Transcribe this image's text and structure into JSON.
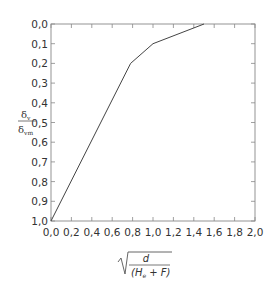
{
  "chart_data": {
    "type": "line",
    "title": "",
    "xlabel": {
      "numerator": "d",
      "denominator_open": "(H",
      "denominator_sub": "e",
      "denominator_rest": " + F)",
      "radical": "√"
    },
    "ylabel": {
      "numerator": "δ",
      "numerator_sub": "v",
      "denominator": "δ",
      "denominator_sub": "vm"
    },
    "xlim": [
      0,
      2.0
    ],
    "ylim": [
      0,
      1.0
    ],
    "y_inverted": true,
    "grid": false,
    "xticks": [
      0,
      0.2,
      0.4,
      0.6,
      0.8,
      1.0,
      1.2,
      1.4,
      1.6,
      1.8,
      2.0
    ],
    "xtick_labels": [
      "0,0",
      "0,2",
      "0,4",
      "0,6",
      "0,8",
      "1,0",
      "1,2",
      "1,4",
      "1,6",
      "1,8",
      "2,0"
    ],
    "yticks": [
      0,
      0.1,
      0.2,
      0.3,
      0.4,
      0.5,
      0.6,
      0.7,
      0.8,
      0.9,
      1.0
    ],
    "ytick_labels": [
      "0,0",
      "0,1",
      "0,2",
      "0,3",
      "0,4",
      "0,5",
      "0,6",
      "0,7",
      "0,8",
      "0,9",
      "1,0"
    ],
    "series": [
      {
        "name": "envelope",
        "x": [
          0.0,
          0.78,
          1.0,
          1.5
        ],
        "y": [
          1.0,
          0.2,
          0.1,
          0.0
        ]
      }
    ],
    "colors": {
      "line": "#444444",
      "frame": "#888888",
      "text": "#333333"
    }
  }
}
